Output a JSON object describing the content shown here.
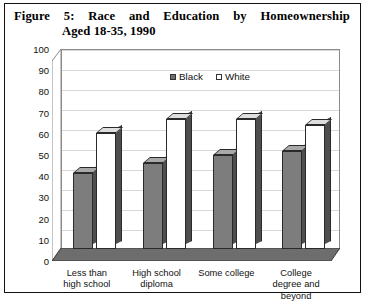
{
  "figure": {
    "title_line1": "Figure 5:  Race  and  Education  by  Homeownership",
    "title_line2": "Aged 18-35, 1990"
  },
  "legend": {
    "items": [
      {
        "label": "Black",
        "color": "#6f6f6f"
      },
      {
        "label": "White",
        "color": "#ffffff"
      }
    ]
  },
  "axis": {
    "y_ticks": [
      "100",
      "90",
      "80",
      "70",
      "60",
      "50",
      "40",
      "30",
      "20",
      "10",
      "0"
    ]
  },
  "chart_data": {
    "type": "bar",
    "title": "Figure 5: Race and Education by Homeownership Aged 18-35, 1990",
    "xlabel": "",
    "ylabel": "",
    "ylim": [
      0,
      100
    ],
    "ytick_step": 10,
    "grid": true,
    "legend_position": "top-center",
    "categories": [
      "Less than\nhigh school",
      "High school\ndiploma",
      "Some college",
      "College\ndegree and\nbeyond"
    ],
    "series": [
      {
        "name": "Black",
        "color": "#7d7d7d",
        "values": [
          38,
          43,
          47,
          49
        ]
      },
      {
        "name": "White",
        "color": "#ffffff",
        "values": [
          58,
          65,
          65,
          62
        ]
      }
    ]
  },
  "x_category_lines": [
    [
      "Less than",
      "high school"
    ],
    [
      "High school",
      "diploma"
    ],
    [
      "Some college"
    ],
    [
      "College",
      "degree and",
      "beyond"
    ]
  ]
}
